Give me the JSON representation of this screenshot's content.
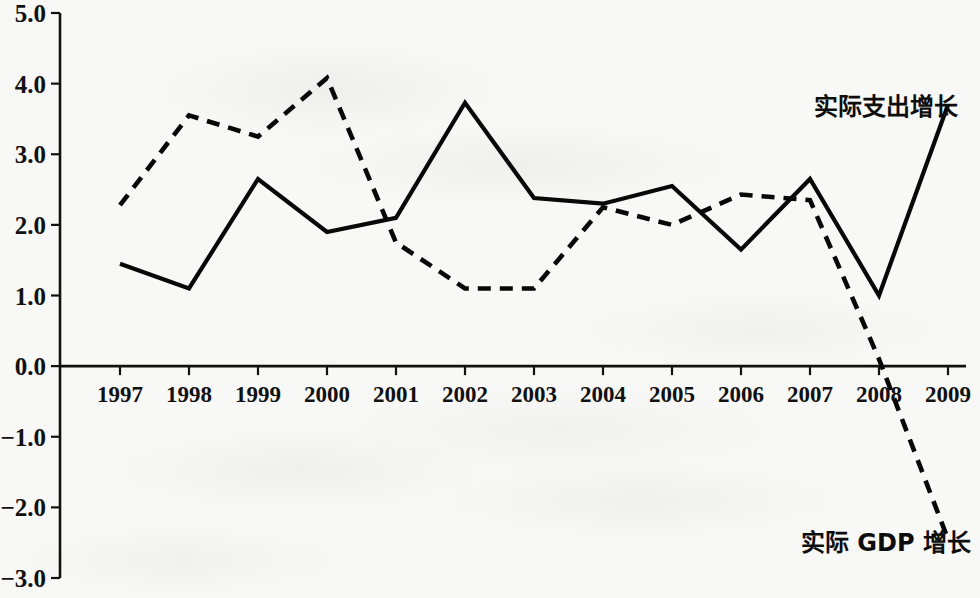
{
  "chart_data": {
    "type": "line",
    "title": "",
    "subtitle": "",
    "xlabel": "",
    "ylabel": "",
    "categories": [
      "1997",
      "1998",
      "1999",
      "2000",
      "2001",
      "2002",
      "2003",
      "2004",
      "2005",
      "2006",
      "2007",
      "2008",
      "2009"
    ],
    "x": [
      1997,
      1998,
      1999,
      2000,
      2001,
      2002,
      2003,
      2004,
      2005,
      2006,
      2007,
      2008,
      2009
    ],
    "xlim": [
      1997,
      2009
    ],
    "ylim": [
      -3.0,
      5.0
    ],
    "y_ticks": [
      "5.0",
      "4.0",
      "3.0",
      "2.0",
      "1.0",
      "0.0",
      "−1.0",
      "−2.0",
      "−3.0"
    ],
    "y_tick_values": [
      5.0,
      4.0,
      3.0,
      2.0,
      1.0,
      0.0,
      -1.0,
      -2.0,
      -3.0
    ],
    "grid": false,
    "legend_position": "inline-annotation",
    "zero_line": true,
    "series": [
      {
        "name": "实际支出增长",
        "style": "solid",
        "color": "#080808",
        "label_x": 2008.1,
        "label_y": 3.55,
        "values": [
          1.45,
          1.1,
          2.65,
          1.9,
          2.1,
          3.73,
          2.38,
          2.3,
          2.55,
          1.65,
          2.65,
          1.0,
          3.7
        ]
      },
      {
        "name": "实际 GDP 增长",
        "style": "dashed",
        "color": "#080808",
        "label_x": 2008.1,
        "label_y": -2.62,
        "values": [
          2.28,
          3.55,
          3.25,
          4.08,
          1.75,
          1.1,
          1.1,
          2.25,
          2.0,
          2.43,
          2.35,
          0.1,
          -2.45
        ]
      }
    ]
  },
  "axis": {
    "y_axis_name": "y-axis",
    "x_axis_name": "x-axis"
  }
}
